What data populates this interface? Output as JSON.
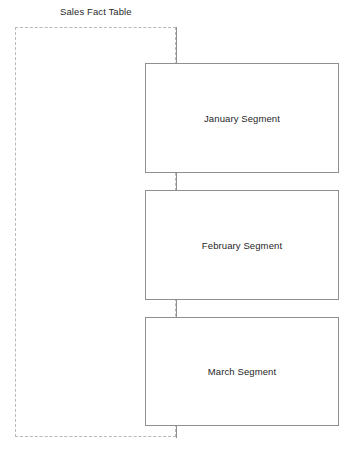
{
  "diagram": {
    "type": "fact-table-partition-diagram",
    "boundary": {
      "title": "Sales Fact Table",
      "style": "dashed",
      "color": "#b9b9b9"
    },
    "segments": [
      {
        "label": "January Segment"
      },
      {
        "label": "February Segment"
      },
      {
        "label": "March Segment"
      }
    ],
    "connectors": {
      "color": "#8f8f8f",
      "count": 4
    },
    "colors": {
      "background": "#ffffff",
      "box_border": "#8f8f8f",
      "boundary_border": "#b9b9b9",
      "text": "#262626"
    },
    "caption": ""
  }
}
